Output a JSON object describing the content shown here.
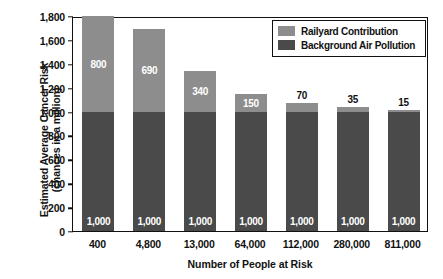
{
  "chart_data": {
    "type": "bar",
    "subtype": "stacked-vertical",
    "title": "",
    "xlabel": "Number of People at Risk",
    "ylabel": "Estimated Average Cancer Risk (chances in a million)",
    "ylabel_lines": [
      "Estimated Average Cancer Risk",
      "(chances in a million)"
    ],
    "categories": [
      "400",
      "4,800",
      "13,000",
      "64,000",
      "112,000",
      "280,000",
      "811,000"
    ],
    "series": [
      {
        "name": "Background Air Pollution",
        "color": "#4a4a4a",
        "values": [
          1000,
          1000,
          1000,
          1000,
          1000,
          1000,
          1000
        ],
        "labels": [
          "1,000",
          "1,000",
          "1,000",
          "1,000",
          "1,000",
          "1,000",
          "1,000"
        ]
      },
      {
        "name": "Railyard Contribution",
        "color": "#8d8d8d",
        "values": [
          800,
          690,
          340,
          150,
          70,
          35,
          15
        ],
        "labels": [
          "800",
          "690",
          "340",
          "150",
          "70",
          "35",
          "15"
        ]
      }
    ],
    "totals": [
      1800,
      1690,
      1340,
      1150,
      1070,
      1035,
      1015
    ],
    "ylim": [
      0,
      1800
    ],
    "yticks": [
      0,
      200,
      400,
      600,
      800,
      1000,
      1200,
      1400,
      1600,
      1800
    ],
    "ytick_labels": [
      "0",
      "200",
      "400",
      "600",
      "800",
      "1,000",
      "1,200",
      "1,400",
      "1,600",
      "1,800"
    ],
    "grid": false,
    "legend_position": "top-right",
    "label_placement": [
      "inside",
      "inside",
      "inside",
      "inside",
      "above",
      "above",
      "above"
    ]
  },
  "legend": {
    "items": [
      {
        "label": "Railyard Contribution",
        "color": "#8d8d8d"
      },
      {
        "label": "Background Air Pollution",
        "color": "#4a4a4a"
      }
    ]
  },
  "colors": {
    "railyard": "#8d8d8d",
    "background_pollution": "#4a4a4a",
    "axis": "#111111",
    "plot_background": "#ffffff"
  }
}
